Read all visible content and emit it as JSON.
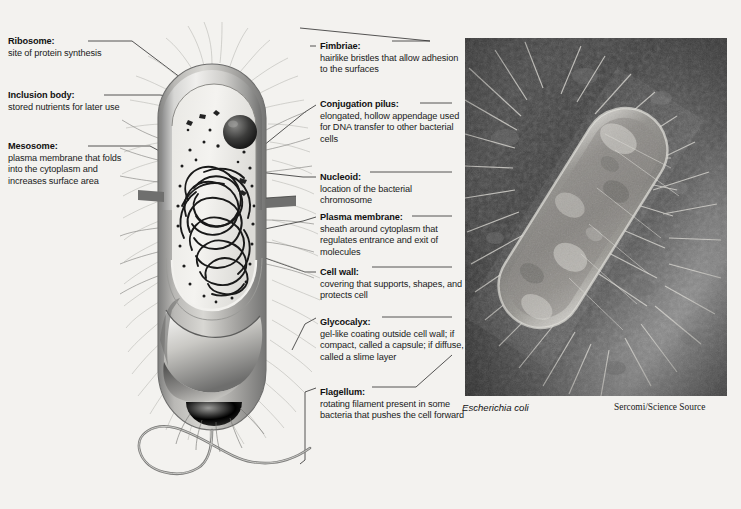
{
  "figure": {
    "background_color": "#f3f2ef"
  },
  "labels_left": [
    {
      "id": "ribosome",
      "heading": "Ribosome:",
      "body": "site of protein synthesis"
    },
    {
      "id": "inclusion-body",
      "heading": "Inclusion body:",
      "body": "stored nutrients for later use"
    },
    {
      "id": "mesosome",
      "heading": "Mesosome:",
      "body": "plasma membrane that folds into the cytoplasm and increases surface area"
    }
  ],
  "labels_right": [
    {
      "id": "fimbriae",
      "heading": "Fimbriae:",
      "body": "hairlike bristles that allow adhesion to the surfaces"
    },
    {
      "id": "conjugation-pilus",
      "heading": "Conjugation pilus:",
      "body": "elongated, hollow appendage used for DNA transfer to other bacterial cells"
    },
    {
      "id": "nucleoid",
      "heading": "Nucleoid:",
      "body": "location of the bacterial chromosome"
    },
    {
      "id": "plasma-membrane",
      "heading": "Plasma membrane:",
      "body": "sheath around cytoplasm that regulates entrance and exit of molecules"
    },
    {
      "id": "cell-wall",
      "heading": "Cell wall:",
      "body": "covering that supports, shapes, and protects cell"
    },
    {
      "id": "glycocalyx",
      "heading": "Glycocalyx:",
      "body": "gel-like coating outside cell wall; if compact, called a capsule; if diffuse, called a slime layer"
    },
    {
      "id": "flagellum",
      "heading": "Flagellum:",
      "body": "rotating filament present in some bacteria that pushes the cell forward"
    }
  ],
  "photo": {
    "specimen_name": "Escherichia coli",
    "credit": "Sercomi/Science Source"
  }
}
